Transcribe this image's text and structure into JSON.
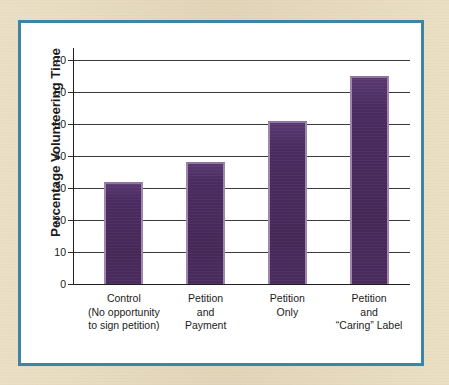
{
  "figure": {
    "frame_color": "#3a85a8",
    "page_background": "#e8dbbd",
    "panel_background": "#ffffff"
  },
  "chart_data": {
    "type": "bar",
    "title": "",
    "subtitle": "",
    "xlabel": "",
    "ylabel": "Percentage Volunteering Time",
    "ylim": [
      0,
      70
    ],
    "ytick_interval": 10,
    "yticks": [
      0,
      10,
      20,
      30,
      40,
      50,
      60,
      70
    ],
    "ytick_labels": [
      "0",
      "10",
      "20",
      "30",
      "40",
      "50",
      "60",
      "70"
    ],
    "grid": true,
    "grid_axis": "y",
    "legend": false,
    "legend_position": "none",
    "bar_color": "#4d2d63",
    "bar_edge_color": "#9e86ae",
    "categories": [
      "Control\n(No opportunity\nto sign petition)",
      "Petition\nand\nPayment",
      "Petition\nOnly",
      "Petition\nand\n“Caring” Label"
    ],
    "category_lines": [
      [
        "Control",
        "(No opportunity",
        "to sign petition)"
      ],
      [
        "Petition",
        "and",
        "Payment"
      ],
      [
        "Petition",
        "Only"
      ],
      [
        "Petition",
        "and",
        "“Caring” Label"
      ]
    ],
    "values": [
      32,
      38,
      51,
      65
    ]
  }
}
